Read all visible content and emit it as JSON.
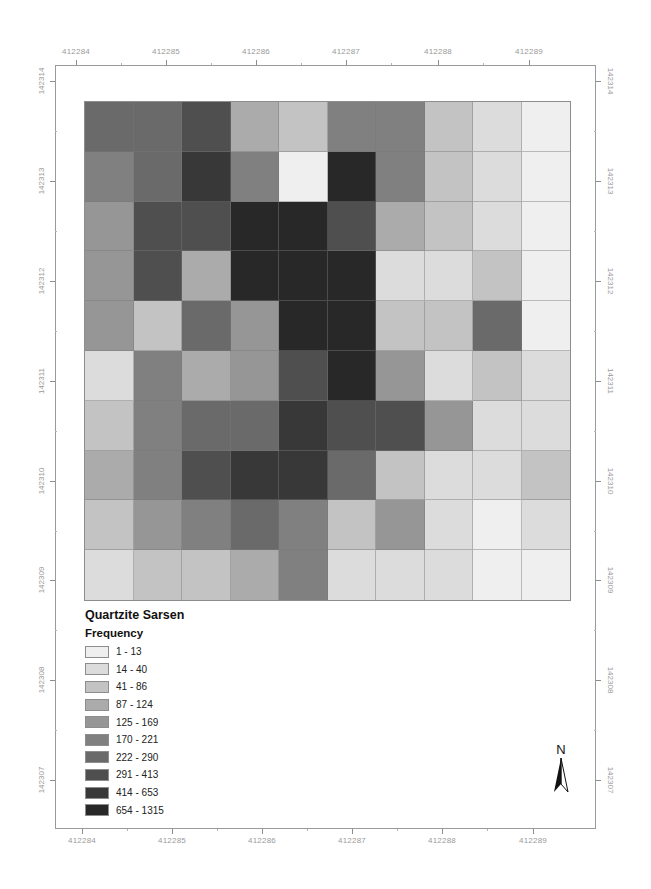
{
  "map": {
    "title": "Quartzite Sarsen",
    "legend_subtitle": "Frequency",
    "x_ticks": [
      "412284",
      "412285",
      "412286",
      "412287",
      "412288",
      "412289"
    ],
    "y_ticks": [
      "142314",
      "142313",
      "142312",
      "142311",
      "142310",
      "142309",
      "142308",
      "142307"
    ],
    "north_label": "N"
  },
  "legend": [
    {
      "label": "1 - 13",
      "color": "#efefef"
    },
    {
      "label": "14 - 40",
      "color": "#dcdcdc"
    },
    {
      "label": "41 - 86",
      "color": "#c3c3c3"
    },
    {
      "label": "87 - 124",
      "color": "#ababab"
    },
    {
      "label": "125 - 169",
      "color": "#969696"
    },
    {
      "label": "170 - 221",
      "color": "#808080"
    },
    {
      "label": "222 - 290",
      "color": "#6a6a6a"
    },
    {
      "label": "291 - 413",
      "color": "#4f4f4f"
    },
    {
      "label": "414 - 653",
      "color": "#383838"
    },
    {
      "label": "654 - 1315",
      "color": "#282828"
    }
  ],
  "chart_data": {
    "type": "heatmap",
    "title": "Quartzite Sarsen",
    "legend_title": "Frequency",
    "classes": [
      "1 - 13",
      "14 - 40",
      "41 - 86",
      "87 - 124",
      "125 - 169",
      "170 - 221",
      "222 - 290",
      "291 - 413",
      "414 - 653",
      "654 - 1315"
    ],
    "x_tick_labels": [
      "412284",
      "412285",
      "412286",
      "412287",
      "412288",
      "412289"
    ],
    "y_tick_labels": [
      "142314",
      "142313",
      "142312",
      "142311",
      "142310",
      "142309",
      "142308",
      "142307"
    ],
    "grid_rows": 10,
    "grid_cols": 10,
    "cell_class_index": [
      [
        6,
        6,
        7,
        3,
        2,
        5,
        5,
        2,
        1,
        0
      ],
      [
        5,
        6,
        8,
        5,
        0,
        9,
        5,
        2,
        1,
        0
      ],
      [
        4,
        7,
        7,
        9,
        9,
        7,
        3,
        2,
        1,
        0
      ],
      [
        4,
        7,
        3,
        9,
        9,
        9,
        1,
        1,
        2,
        0
      ],
      [
        4,
        2,
        6,
        4,
        9,
        9,
        2,
        2,
        6,
        0
      ],
      [
        1,
        5,
        3,
        4,
        7,
        9,
        4,
        1,
        2,
        1
      ],
      [
        2,
        5,
        6,
        6,
        8,
        7,
        7,
        4,
        1,
        1
      ],
      [
        3,
        5,
        7,
        8,
        8,
        6,
        2,
        1,
        1,
        2
      ],
      [
        2,
        4,
        5,
        6,
        5,
        2,
        4,
        1,
        0,
        1
      ],
      [
        1,
        2,
        2,
        3,
        5,
        1,
        1,
        1,
        0,
        0
      ]
    ],
    "legend_position": "bottom-left"
  }
}
